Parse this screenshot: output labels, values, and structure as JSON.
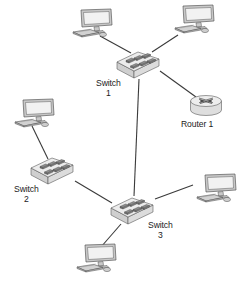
{
  "diagram": {
    "type": "network-topology",
    "title": "",
    "background_color": "#ffffff",
    "line_color": "#3a3a3a",
    "device_fill_top": "#e8e8e8",
    "device_fill_side": "#c9c9c9",
    "device_stroke": "#555555",
    "label_color": "#1b1b1b",
    "nodes": [
      {
        "id": "pc1",
        "kind": "computer",
        "icon": "desktop-computer-icon",
        "label": "",
        "x": 68,
        "y": 8,
        "w": 46,
        "h": 34,
        "flip": false
      },
      {
        "id": "pc2",
        "kind": "computer",
        "icon": "desktop-computer-icon",
        "label": "",
        "x": 170,
        "y": 4,
        "w": 46,
        "h": 34,
        "flip": false
      },
      {
        "id": "switch1",
        "kind": "switch",
        "icon": "network-switch-icon",
        "label": "Switch",
        "label_line2": "1",
        "x": 114,
        "y": 47,
        "w": 48,
        "h": 33,
        "label_x": 96,
        "label_y": 79
      },
      {
        "id": "router1",
        "kind": "router",
        "icon": "network-router-icon",
        "label": "Router 1",
        "label_line2": "",
        "x": 189,
        "y": 93,
        "w": 34,
        "h": 26,
        "label_x": 181,
        "label_y": 120
      },
      {
        "id": "pc3",
        "kind": "computer",
        "icon": "desktop-computer-icon",
        "label": "",
        "x": 10,
        "y": 98,
        "w": 46,
        "h": 34,
        "flip": false
      },
      {
        "id": "switch2",
        "kind": "switch",
        "icon": "network-switch-icon",
        "label": "Switch",
        "label_line2": "2",
        "x": 28,
        "y": 153,
        "w": 48,
        "h": 33,
        "label_x": 14,
        "label_y": 185
      },
      {
        "id": "switch3",
        "kind": "switch",
        "icon": "network-switch-icon",
        "label": "Switch",
        "label_line2": "3",
        "x": 108,
        "y": 193,
        "w": 48,
        "h": 33,
        "label_x": 148,
        "label_y": 221
      },
      {
        "id": "pc4",
        "kind": "computer",
        "icon": "desktop-computer-icon",
        "label": "",
        "x": 192,
        "y": 173,
        "w": 46,
        "h": 34,
        "flip": false
      },
      {
        "id": "pc5",
        "kind": "computer",
        "icon": "desktop-computer-icon",
        "label": "",
        "x": 72,
        "y": 243,
        "w": 46,
        "h": 34,
        "flip": false
      }
    ],
    "links": [
      {
        "id": "pc1-switch1",
        "from": "pc1",
        "to": "switch1",
        "x1": 100,
        "y1": 36,
        "x2": 131,
        "y2": 53
      },
      {
        "id": "pc2-switch1",
        "from": "pc2",
        "to": "switch1",
        "x1": 178,
        "y1": 35,
        "x2": 152,
        "y2": 52
      },
      {
        "id": "switch1-router1",
        "from": "switch1",
        "to": "router1",
        "x1": 160,
        "y1": 71,
        "x2": 196,
        "y2": 97
      },
      {
        "id": "switch1-switch3",
        "from": "switch1",
        "to": "switch3",
        "x1": 139,
        "y1": 79,
        "x2": 134,
        "y2": 196
      },
      {
        "id": "pc3-switch2",
        "from": "pc3",
        "to": "switch2",
        "x1": 32,
        "y1": 126,
        "x2": 48,
        "y2": 159
      },
      {
        "id": "switch2-switch3",
        "from": "switch2",
        "to": "switch3",
        "x1": 75,
        "y1": 181,
        "x2": 112,
        "y2": 203
      },
      {
        "id": "switch3-pc4",
        "from": "switch3",
        "to": "pc4",
        "x1": 155,
        "y1": 199,
        "x2": 193,
        "y2": 185
      },
      {
        "id": "switch3-pc5",
        "from": "switch3",
        "to": "pc5",
        "x1": 121,
        "y1": 224,
        "x2": 101,
        "y2": 247
      }
    ]
  }
}
